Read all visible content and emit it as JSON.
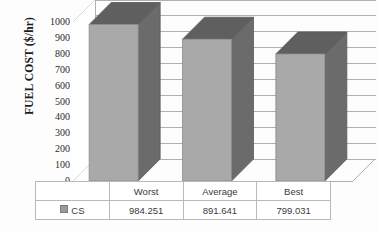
{
  "chart_data": {
    "type": "bar",
    "title": "",
    "subtitle": "",
    "xlabel": "",
    "ylabel": "FUEL COST ($/hr)",
    "categories": [
      "Worst",
      "Average",
      "Best"
    ],
    "series": [
      {
        "name": "CS",
        "values": [
          984.251,
          891.641,
          799.031
        ],
        "value_labels": [
          "984.251",
          "891.641",
          "799.031"
        ],
        "color": "#a9a9a9",
        "side_color": "#6b6b6b",
        "top_color": "#5f5f5f"
      }
    ],
    "ylim": [
      0,
      1000
    ],
    "ytick_step": 100,
    "ytick_labels": [
      "1000",
      "900",
      "800",
      "700",
      "600",
      "500",
      "400",
      "300",
      "200",
      "100",
      "0"
    ],
    "ytick_values": [
      1000,
      900,
      800,
      700,
      600,
      500,
      400,
      300,
      200,
      100,
      0
    ],
    "grid": true,
    "grid_orientation": "horizontal-3d",
    "legend": {
      "position": "bottom-table",
      "entries": [
        {
          "label": "CS",
          "swatch_color": "#9a9a9a"
        }
      ]
    },
    "style": "3d-clustered-column",
    "data_table_visible": true,
    "plot_area_color": "#ffffff",
    "gridline_color": "#b0b0b0"
  },
  "axes": {
    "y": {
      "title": "FUEL COST ($/hr)",
      "ticks": [
        "1000",
        "900",
        "800",
        "700",
        "600",
        "500",
        "400",
        "300",
        "200",
        "100",
        "0"
      ]
    }
  },
  "table": {
    "header_row": [
      "",
      "Worst",
      "Average",
      "Best"
    ],
    "data_row": [
      "CS",
      "984.251",
      "891.641",
      "799.031"
    ],
    "legend_label": "CS"
  }
}
